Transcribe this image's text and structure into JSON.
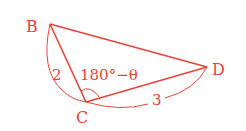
{
  "diagram": {
    "type": "triangle",
    "color": "#e8443a",
    "vertices": [
      {
        "id": "B",
        "label": "B"
      },
      {
        "id": "C",
        "label": "C"
      },
      {
        "id": "D",
        "label": "D"
      }
    ],
    "segments": [
      {
        "from": "B",
        "to": "C"
      },
      {
        "from": "C",
        "to": "D"
      },
      {
        "from": "B",
        "to": "D"
      }
    ],
    "lengths": [
      {
        "side": "BC",
        "label": "2"
      },
      {
        "side": "CD",
        "label": "3"
      }
    ],
    "angle": {
      "vertex": "C",
      "label": "180°−θ"
    }
  }
}
